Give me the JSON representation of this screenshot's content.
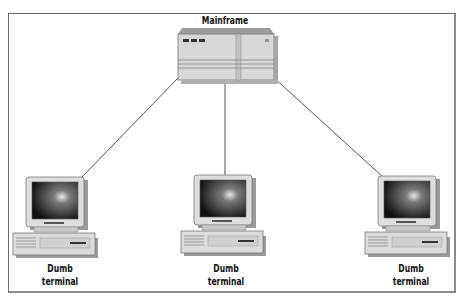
{
  "diagram": {
    "type": "network-topology",
    "nodes": [
      {
        "id": "mainframe",
        "label": "Mainframe",
        "kind": "mainframe"
      },
      {
        "id": "terminal-left",
        "label_line1": "Dumb",
        "label_line2": "terminal",
        "kind": "dumb-terminal"
      },
      {
        "id": "terminal-center",
        "label_line1": "Dumb",
        "label_line2": "terminal",
        "kind": "dumb-terminal"
      },
      {
        "id": "terminal-right",
        "label_line1": "Dumb",
        "label_line2": "terminal",
        "kind": "dumb-terminal"
      }
    ],
    "edges": [
      {
        "from": "mainframe",
        "to": "terminal-left"
      },
      {
        "from": "mainframe",
        "to": "terminal-center"
      },
      {
        "from": "mainframe",
        "to": "terminal-right"
      }
    ]
  },
  "colors": {
    "frame": "#6a6a6a",
    "line": "#555555",
    "device_body": "#dcdcdc",
    "device_shadow": "#9a9a9a",
    "screen_dark": "#1a1a1a"
  }
}
